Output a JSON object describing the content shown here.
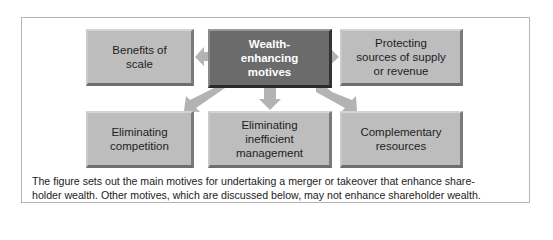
{
  "diagram": {
    "center": {
      "line1": "Wealth-",
      "line2": "enhancing",
      "line3": "motives"
    },
    "nodes": [
      {
        "id": "benefits-of-scale",
        "lines": [
          "Benefits of",
          "scale"
        ]
      },
      {
        "id": "protecting-sources",
        "lines": [
          "Protecting",
          "sources of supply",
          "or revenue"
        ]
      },
      {
        "id": "eliminating-competition",
        "lines": [
          "Eliminating",
          "competition"
        ]
      },
      {
        "id": "eliminating-inefficient-management",
        "lines": [
          "Eliminating",
          "inefficient",
          "management"
        ]
      },
      {
        "id": "complementary-resources",
        "lines": [
          "Complementary",
          "resources"
        ]
      }
    ],
    "colors": {
      "center_box": "#6b6b6b",
      "outer_box": "#bdbdbd",
      "arrow": "#b3b3b3"
    }
  },
  "caption": {
    "line1": "The figure sets out the main motives for undertaking a merger or takeover that enhance share-",
    "line2": "holder wealth. Other motives, which are discussed below, may not enhance shareholder wealth."
  }
}
